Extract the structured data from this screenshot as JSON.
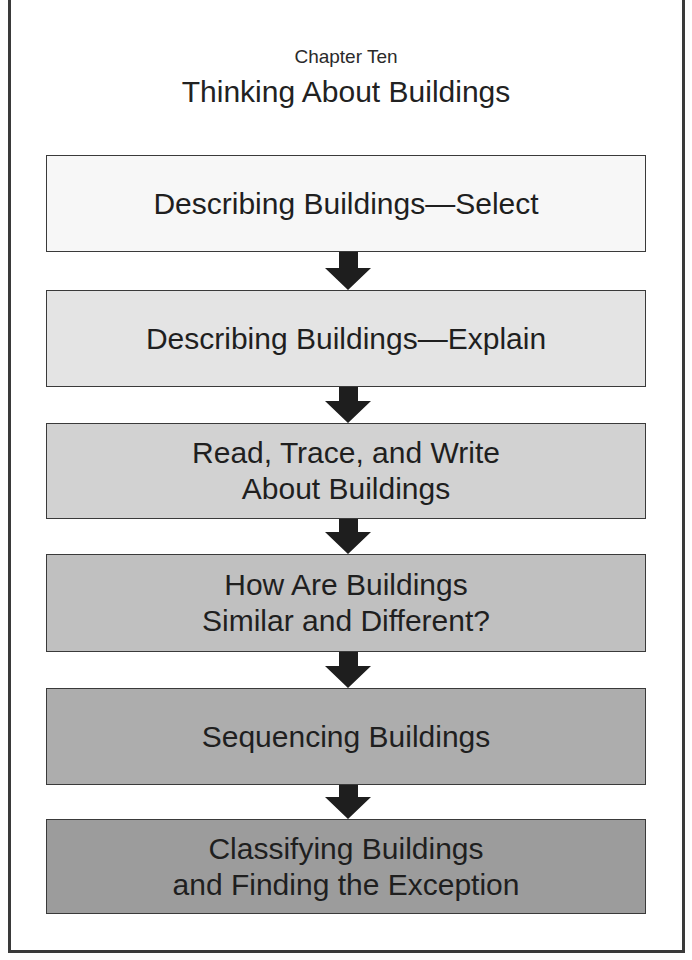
{
  "header": {
    "subtitle": "Chapter Ten",
    "title": "Thinking About Buildings"
  },
  "steps": [
    {
      "label": "Describing Buildings—Select",
      "fill": "#f7f7f7"
    },
    {
      "label": "Describing Buildings—Explain",
      "fill": "#e4e4e4"
    },
    {
      "label": "Read, Trace, and Write\nAbout Buildings",
      "fill": "#d2d2d2"
    },
    {
      "label": "How Are Buildings\nSimilar and Different?",
      "fill": "#c0c0c0"
    },
    {
      "label": "Sequencing Buildings",
      "fill": "#adadad"
    },
    {
      "label": "Classifying Buildings\nand Finding the Exception",
      "fill": "#9c9c9c"
    }
  ],
  "colors": {
    "border": "#3a3a3a",
    "arrow": "#1e1e1e"
  }
}
